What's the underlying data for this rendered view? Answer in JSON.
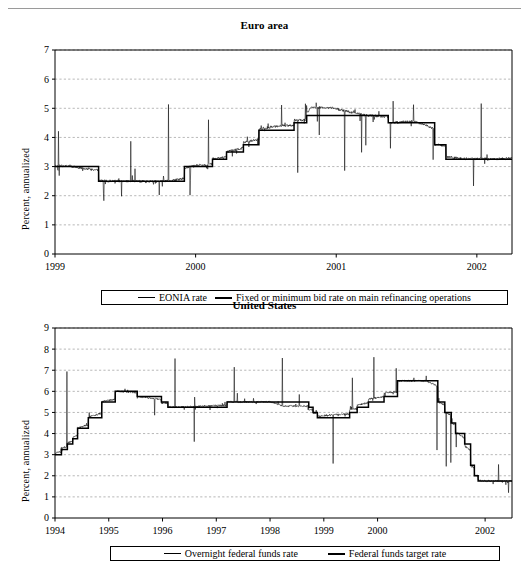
{
  "page": {
    "has_top_rule": true,
    "background": "#ffffff",
    "ink": "#000000",
    "gridline_color": "#999999"
  },
  "charts": [
    {
      "id": "euro-area",
      "title": "Euro area",
      "ylabel": "Percent, annualized",
      "legend": [
        {
          "label": "EONIA rate",
          "style": "thin"
        },
        {
          "label": "Fixed or minimum bid rate on main refinancing operations",
          "style": "thick"
        }
      ]
    },
    {
      "id": "united-states",
      "title": "United States",
      "ylabel": "Percent, annualized",
      "legend": [
        {
          "label": "Overnight federal funds rate",
          "style": "thin"
        },
        {
          "label": "Federal funds target rate",
          "style": "thick"
        }
      ]
    }
  ],
  "chart_data": [
    {
      "type": "line",
      "id": "euro-area",
      "title": "Euro area",
      "xlabel": "",
      "ylabel": "Percent, annualized",
      "ylim": [
        0,
        7
      ],
      "yticks": [
        0,
        1,
        2,
        3,
        4,
        5,
        6,
        7
      ],
      "ytick_labels": [
        "0",
        "1",
        "2",
        "3",
        "4",
        "5",
        "6",
        "7"
      ],
      "xlim": [
        1999.0,
        2002.25
      ],
      "xticks": [
        1999,
        2000,
        2001,
        2002
      ],
      "xtick_labels": [
        "1999",
        "2000",
        "2001",
        "2002"
      ],
      "grid": "horizontal-dashed",
      "legend_position": "below-plot",
      "series": [
        {
          "name": "Fixed or minimum bid rate on main refinancing operations",
          "style": "step",
          "linewidth": "thick",
          "x": [
            1999.0,
            1999.31,
            1999.83,
            1999.92,
            2000.12,
            2000.22,
            2000.34,
            2000.45,
            2000.55,
            2000.7,
            2000.79,
            2001.37,
            2001.7,
            2001.78,
            2001.86,
            2002.25
          ],
          "values": [
            3.0,
            2.5,
            2.5,
            3.0,
            3.25,
            3.5,
            3.75,
            4.25,
            4.25,
            4.5,
            4.75,
            4.5,
            3.75,
            3.25,
            3.25,
            3.25
          ]
        },
        {
          "name": "EONIA rate",
          "style": "noisy-daily",
          "linewidth": "thin",
          "description": "Overnight interbank rate tracking the policy rate with frequent downward spikes in 1999 (to ~1.7-2.2) and sharp upward spikes in late 2000 (to ~5.7) and mid-2001 (to ~4.7)",
          "anchor_x": [
            1999.0,
            1999.1,
            1999.31,
            1999.5,
            1999.7,
            1999.83,
            2000.0,
            2000.2,
            2000.4,
            2000.6,
            2000.78,
            2000.82,
            2000.95,
            2001.2,
            2001.4,
            2001.55,
            2001.7,
            2001.9,
            2002.1,
            2002.25
          ],
          "anchor_values": [
            3.1,
            3.05,
            2.55,
            2.5,
            2.45,
            2.55,
            3.1,
            3.45,
            4.25,
            4.8,
            4.85,
            5.7,
            5.75,
            4.8,
            4.55,
            4.7,
            3.8,
            3.3,
            3.3,
            3.35
          ],
          "spike_low_min": 1.7,
          "spike_high_max": 5.75
        }
      ]
    },
    {
      "type": "line",
      "id": "united-states",
      "title": "United States",
      "xlabel": "",
      "ylabel": "Percent, annualized",
      "ylim": [
        0,
        9
      ],
      "yticks": [
        0,
        1,
        2,
        3,
        4,
        5,
        6,
        7,
        8,
        9
      ],
      "ytick_labels": [
        "0",
        "1",
        "2",
        "3",
        "4",
        "5",
        "6",
        "7",
        "8",
        "9"
      ],
      "xlim": [
        1994.0,
        2002.5
      ],
      "xticks": [
        1994,
        1995,
        1996,
        1997,
        1998,
        1999,
        2000,
        2002
      ],
      "xtick_labels": [
        "1994",
        "1995",
        "1996",
        "1997",
        "1998",
        "1999",
        "2000",
        "2002"
      ],
      "grid": "horizontal-dashed",
      "legend_position": "below-plot",
      "series": [
        {
          "name": "Federal funds target rate",
          "style": "step",
          "linewidth": "thick",
          "x": [
            1994.0,
            1994.12,
            1994.23,
            1994.33,
            1994.42,
            1994.62,
            1994.87,
            1995.12,
            1995.53,
            1995.98,
            1996.1,
            1997.2,
            1998.72,
            1998.8,
            1998.88,
            1999.48,
            1999.62,
            1999.83,
            2000.12,
            2000.37,
            2001.0,
            2001.12,
            2001.25,
            2001.37,
            2001.45,
            2001.62,
            2001.73,
            2001.8,
            2001.87,
            2002.5
          ],
          "values": [
            3.0,
            3.25,
            3.5,
            3.75,
            4.25,
            4.75,
            5.5,
            6.0,
            5.75,
            5.5,
            5.25,
            5.5,
            5.25,
            5.0,
            4.75,
            5.0,
            5.25,
            5.5,
            5.75,
            6.5,
            6.5,
            5.5,
            5.0,
            4.5,
            4.0,
            3.5,
            2.5,
            2.0,
            1.75,
            1.75
          ]
        },
        {
          "name": "Overnight federal funds rate",
          "style": "noisy-daily",
          "linewidth": "thin",
          "description": "Effective overnight fed funds rate, very noisy daily series closely tracking the target with frequent upward spikes to 6.5-7.8 and occasional downward dips to ~4.0-4.7",
          "anchor_x": [
            1994.0,
            1994.3,
            1994.6,
            1994.9,
            1995.15,
            1995.5,
            1996.0,
            1996.5,
            1997.0,
            1997.5,
            1998.0,
            1998.25,
            1998.75,
            1999.1,
            1999.5,
            1999.9,
            2000.25,
            2000.9,
            2001.2,
            2001.5,
            2001.75,
            2001.95,
            2002.25,
            2002.5
          ],
          "anchor_values": [
            3.2,
            3.9,
            4.8,
            5.6,
            6.0,
            5.8,
            5.3,
            5.3,
            5.55,
            5.5,
            5.55,
            4.8,
            4.8,
            5.2,
            5.4,
            6.1,
            6.5,
            6.5,
            5.2,
            4.0,
            2.3,
            1.75,
            1.75,
            1.75
          ],
          "spike_low_min": 1.2,
          "spike_high_max": 7.8
        }
      ]
    }
  ]
}
